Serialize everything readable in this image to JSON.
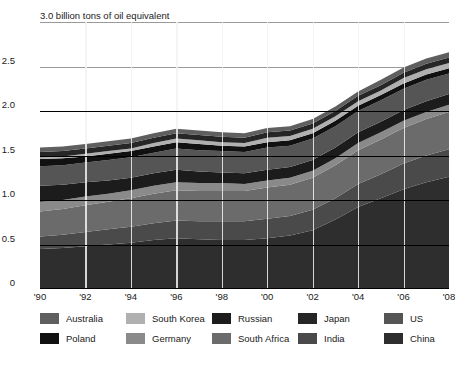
{
  "chart_data": {
    "type": "area",
    "stacked": true,
    "title": "3.0 billion tons of oil equivalent",
    "unit_label": "billion tons of oil equivalent",
    "xlabel": "",
    "ylabel": "",
    "ylim": [
      0,
      3.0
    ],
    "ytick_labels": [
      "0",
      "0.5",
      "1.0",
      "1.5",
      "2.0",
      "2.5",
      "3.0"
    ],
    "ytick_values": [
      0,
      0.5,
      1.0,
      1.5,
      2.0,
      2.5,
      3.0
    ],
    "grid": true,
    "legend_position": "bottom",
    "x": [
      1990,
      1991,
      1992,
      1993,
      1994,
      1995,
      1996,
      1997,
      1998,
      1999,
      2000,
      2001,
      2002,
      2003,
      2004,
      2005,
      2006,
      2007,
      2008
    ],
    "xtick_labels": [
      "'90",
      "'92",
      "'94",
      "'96",
      "'98",
      "'00",
      "'02",
      "'04",
      "'06",
      "'08"
    ],
    "xtick_values": [
      1990,
      1992,
      1994,
      1996,
      1998,
      2000,
      2002,
      2004,
      2006,
      2008
    ],
    "series": [
      {
        "name": "China",
        "color": "#2e2e2e",
        "values": [
          0.45,
          0.46,
          0.48,
          0.5,
          0.52,
          0.55,
          0.57,
          0.56,
          0.55,
          0.55,
          0.57,
          0.6,
          0.66,
          0.78,
          0.92,
          1.02,
          1.12,
          1.2,
          1.26
        ]
      },
      {
        "name": "India",
        "color": "#4a4a4a",
        "values": [
          0.14,
          0.15,
          0.16,
          0.17,
          0.18,
          0.19,
          0.2,
          0.2,
          0.21,
          0.21,
          0.22,
          0.22,
          0.23,
          0.24,
          0.26,
          0.27,
          0.29,
          0.3,
          0.31
        ]
      },
      {
        "name": "South Africa",
        "color": "#6b6b6b",
        "values": [
          0.28,
          0.29,
          0.3,
          0.31,
          0.32,
          0.33,
          0.34,
          0.34,
          0.34,
          0.34,
          0.35,
          0.35,
          0.36,
          0.37,
          0.38,
          0.39,
          0.4,
          0.41,
          0.42
        ]
      },
      {
        "name": "Germany",
        "color": "#8a8a8a",
        "values": [
          0.11,
          0.1,
          0.1,
          0.09,
          0.09,
          0.09,
          0.09,
          0.09,
          0.09,
          0.08,
          0.08,
          0.08,
          0.08,
          0.08,
          0.08,
          0.08,
          0.08,
          0.08,
          0.08
        ]
      },
      {
        "name": "Russian",
        "color": "#1c1c1c",
        "values": [
          0.18,
          0.17,
          0.16,
          0.15,
          0.14,
          0.14,
          0.14,
          0.13,
          0.12,
          0.12,
          0.12,
          0.12,
          0.12,
          0.12,
          0.12,
          0.12,
          0.12,
          0.12,
          0.12
        ]
      },
      {
        "name": "US",
        "color": "#555555",
        "values": [
          0.22,
          0.22,
          0.22,
          0.23,
          0.23,
          0.23,
          0.24,
          0.24,
          0.24,
          0.24,
          0.25,
          0.24,
          0.24,
          0.24,
          0.24,
          0.24,
          0.24,
          0.24,
          0.23
        ]
      },
      {
        "name": "Poland",
        "color": "#111111",
        "values": [
          0.08,
          0.08,
          0.07,
          0.07,
          0.07,
          0.07,
          0.07,
          0.07,
          0.06,
          0.06,
          0.06,
          0.06,
          0.06,
          0.06,
          0.06,
          0.06,
          0.06,
          0.06,
          0.06
        ]
      },
      {
        "name": "South Korea",
        "color": "#b0b0b0",
        "values": [
          0.02,
          0.02,
          0.03,
          0.03,
          0.03,
          0.04,
          0.04,
          0.04,
          0.04,
          0.04,
          0.05,
          0.05,
          0.05,
          0.05,
          0.05,
          0.05,
          0.06,
          0.06,
          0.06
        ]
      },
      {
        "name": "Japan",
        "color": "#262626",
        "values": [
          0.06,
          0.06,
          0.06,
          0.06,
          0.06,
          0.06,
          0.06,
          0.06,
          0.06,
          0.06,
          0.06,
          0.06,
          0.06,
          0.06,
          0.06,
          0.06,
          0.06,
          0.06,
          0.06
        ]
      },
      {
        "name": "Australia",
        "color": "#5f5f5f",
        "values": [
          0.05,
          0.05,
          0.05,
          0.05,
          0.05,
          0.05,
          0.05,
          0.05,
          0.05,
          0.05,
          0.05,
          0.05,
          0.05,
          0.05,
          0.05,
          0.06,
          0.06,
          0.06,
          0.06
        ]
      }
    ],
    "legend": [
      {
        "label": "Australia",
        "color": "#5f5f5f"
      },
      {
        "label": "South Korea",
        "color": "#b0b0b0"
      },
      {
        "label": "Russian",
        "color": "#1c1c1c"
      },
      {
        "label": "Japan",
        "color": "#262626"
      },
      {
        "label": "US",
        "color": "#555555"
      },
      {
        "label": "Poland",
        "color": "#111111"
      },
      {
        "label": "Germany",
        "color": "#8a8a8a"
      },
      {
        "label": "South Africa",
        "color": "#6b6b6b"
      },
      {
        "label": "India",
        "color": "#4a4a4a"
      },
      {
        "label": "China",
        "color": "#2e2e2e"
      }
    ]
  }
}
